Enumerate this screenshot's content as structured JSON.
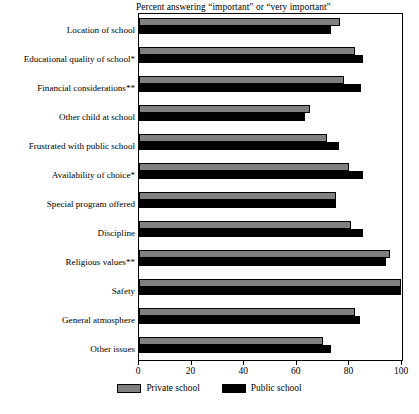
{
  "chart_data": {
    "type": "bar",
    "orientation": "horizontal",
    "title": "Percent answering “important” or “very important”",
    "xlabel": "",
    "ylabel": "",
    "xlim": [
      0,
      100
    ],
    "xticks": [
      0,
      20,
      40,
      60,
      80,
      100
    ],
    "xtick_labels": [
      "0",
      "20",
      "40",
      "60",
      "80",
      "100"
    ],
    "grid": false,
    "legend_position": "bottom",
    "categories": [
      "Location of school",
      "Educational quality of school*",
      "Financial considerations**",
      "Other child at school",
      "Frustrated with public school",
      "Availability of choice*",
      "Special program offered",
      "Discipline",
      "Religious values**",
      "Safety",
      "General atmosphere",
      "Other issues"
    ],
    "series": [
      {
        "name": "Private school",
        "color": "#808080",
        "values": [
          76.5,
          82,
          78,
          65,
          71.5,
          80,
          75,
          80.5,
          95.5,
          99.5,
          82,
          70
        ]
      },
      {
        "name": "Public school",
        "color": "#000000",
        "values": [
          73,
          85,
          84.5,
          63,
          76,
          85,
          75,
          85,
          94,
          99.5,
          84,
          73
        ]
      }
    ]
  },
  "legend": {
    "items": [
      {
        "label": "Private school",
        "swatch": "private"
      },
      {
        "label": "Public school",
        "swatch": "public"
      }
    ]
  }
}
